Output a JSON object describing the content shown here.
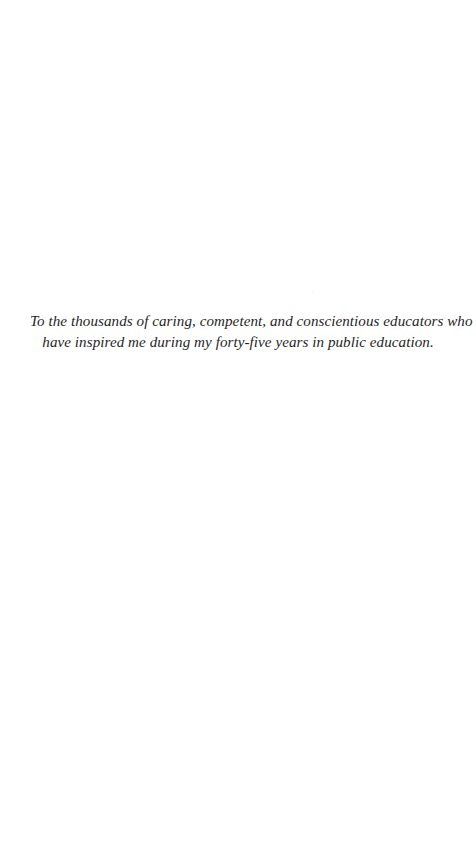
{
  "page": {
    "background_color": "#ffffff",
    "text_color": "#1f1f1f",
    "width": 476,
    "height": 851
  },
  "dedication": {
    "line_1": "To the thousands of caring, competent, and conscientious educators who",
    "line_2": "have inspired me during my forty-five years in public education.",
    "full_text": "To the thousands of caring, competent, and conscientious educators who have inspired me during my forty-five years in public education."
  }
}
